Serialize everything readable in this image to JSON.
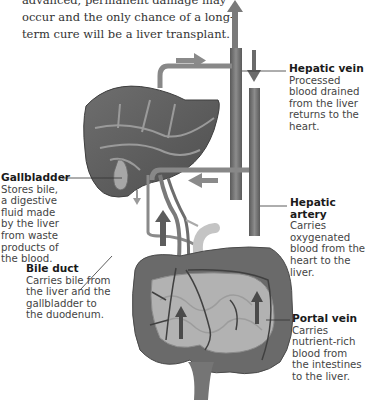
{
  "intro": {
    "text": "advanced, permanent damage may occur and the only chance of a long-term cure will be a liver transplant."
  },
  "labels": {
    "hepatic_vein": {
      "title": "Hepatic vein",
      "desc": "Processed blood drained from the liver returns to the heart."
    },
    "hepatic_artery": {
      "title": "Hepatic artery",
      "desc": "Carries oxygenated blood from the heart to the liver."
    },
    "portal_vein": {
      "title": "Portal vein",
      "desc": "Carries nutrient-rich blood from the intestines to the liver."
    },
    "gallbladder": {
      "title": "Gallbladder",
      "desc": "Stores bile, a digestive fluid made by the liver from waste products of the blood."
    },
    "bile_duct": {
      "title": "Bile duct",
      "desc": "Carries bile from the liver and the gallbladder to the duodenum."
    }
  },
  "colors": {
    "organ_dark": "#5e5e5e",
    "organ_mid": "#8a8a8a",
    "vessel": "#7a7a7a",
    "arrow": "#6b6b6b",
    "text": "#333333"
  }
}
